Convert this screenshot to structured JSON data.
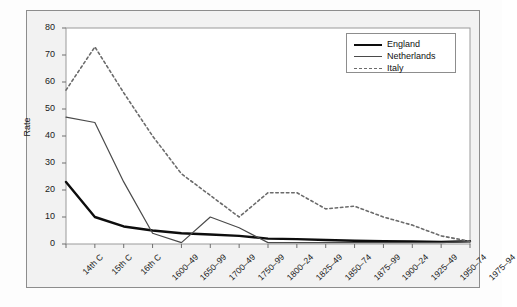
{
  "chart_data": {
    "type": "line",
    "title": "",
    "xlabel": "",
    "ylabel": "Rate",
    "ylim": [
      0,
      80
    ],
    "yticks": [
      0,
      10,
      20,
      30,
      40,
      50,
      60,
      70,
      80
    ],
    "grid": false,
    "legend_position": "top-right",
    "categories": [
      "14th C",
      "15th C",
      "16th C",
      "1600–49",
      "1650–99",
      "1700–49",
      "1750–99",
      "1800–24",
      "1825–49",
      "1850–74",
      "1875–99",
      "1900–24",
      "1925–49",
      "1950–74",
      "1975–94"
    ],
    "series": [
      {
        "name": "England",
        "style": "solid-thick",
        "color": "#0d0d0d",
        "values": [
          23,
          10,
          6.5,
          5,
          4,
          3.5,
          3,
          2,
          1.8,
          1.5,
          1.2,
          1,
          0.9,
          0.8,
          1
        ]
      },
      {
        "name": "Netherlands",
        "style": "solid-thin",
        "color": "#4a4a4a",
        "values": [
          47,
          45,
          23,
          4,
          0.5,
          10,
          6,
          0.5,
          0.5,
          0.5,
          0.5,
          0.5,
          0.5,
          0.5,
          1
        ]
      },
      {
        "name": "Italy",
        "style": "dashed",
        "color": "#6b6b6b",
        "values": [
          57,
          73,
          56,
          40,
          26,
          18,
          10,
          19,
          19,
          13,
          14,
          10,
          7,
          3,
          1
        ]
      }
    ]
  },
  "legend": {
    "items": [
      {
        "label": "England"
      },
      {
        "label": "Netherlands"
      },
      {
        "label": "Italy"
      }
    ]
  },
  "axes": {
    "y_title": "Rate"
  }
}
